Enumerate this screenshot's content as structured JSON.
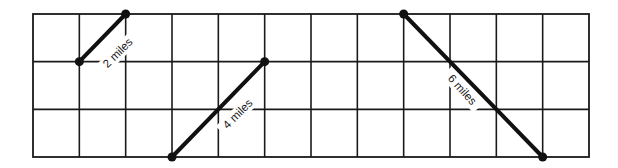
{
  "diagram": {
    "type": "grid-distance-diagram",
    "grid": {
      "columns": 12,
      "rows": 3,
      "origin": {
        "x": 33,
        "y": 14
      },
      "width": 556,
      "height": 143,
      "line_color": "#1a1a1a"
    },
    "segments": [
      {
        "id": "segment-2-miles",
        "label": "2 miles",
        "start": {
          "col": 1,
          "row": 1
        },
        "end": {
          "col": 2,
          "row": 0
        },
        "label_pos": {
          "x": 118,
          "y": 53
        },
        "label_angle": -45
      },
      {
        "id": "segment-4-miles",
        "label": "4 miles",
        "start": {
          "col": 3,
          "row": 3
        },
        "end": {
          "col": 5,
          "row": 1
        },
        "label_pos": {
          "x": 238,
          "y": 114
        },
        "label_angle": -45
      },
      {
        "id": "segment-6-miles",
        "label": "6 miles",
        "start": {
          "col": 8,
          "row": 0
        },
        "end": {
          "col": 11,
          "row": 3
        },
        "label_pos": {
          "x": 462,
          "y": 90
        },
        "label_angle": 48
      }
    ],
    "segment_color": "#111111"
  }
}
